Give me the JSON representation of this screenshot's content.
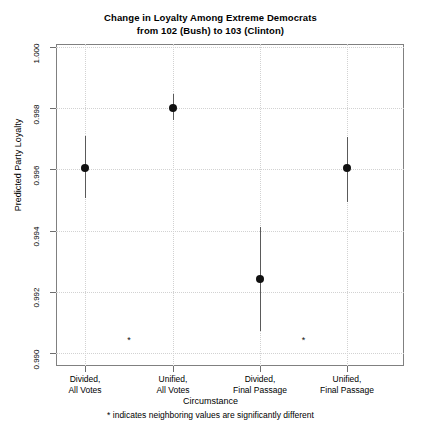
{
  "chart_data": {
    "type": "scatter",
    "title": "Change in Loyalty Among Extreme Democrats",
    "subtitle": "from 102 (Bush) to 103 (Clinton)",
    "xlabel": "Circumstance",
    "ylabel": "Predicted Party Loyalty",
    "footnote": "* indicates neighboring values are significantly different",
    "categories": [
      "Divided, All Votes",
      "Unified, All Votes",
      "Divided, Final Passage",
      "Unified, Final Passage"
    ],
    "category_lines": [
      [
        "Divided,",
        "All Votes"
      ],
      [
        "Unified,",
        "All Votes"
      ],
      [
        "Divided,",
        "Final Passage"
      ],
      [
        "Unified,",
        "Final Passage"
      ]
    ],
    "values": [
      0.99606,
      0.998,
      0.99243,
      0.99603
    ],
    "ci_lower": [
      0.99508,
      0.99761,
      0.99073,
      0.99495
    ],
    "ci_upper": [
      0.99708,
      0.99846,
      0.99411,
      0.99705
    ],
    "ylim": [
      0.99,
      1.0
    ],
    "yticks": [
      0.99,
      0.992,
      0.994,
      0.996,
      0.998,
      1.0
    ],
    "ytick_labels": [
      "0.990",
      "0.992",
      "0.994",
      "0.996",
      "0.998",
      "1.000"
    ],
    "grid": true,
    "legend": "none",
    "significance_markers": [
      {
        "between": "Divided, All Votes / Unified, All Votes",
        "label": "*",
        "x_value": 1.5,
        "y_value": 0.99043
      },
      {
        "between": "Divided, Final Passage / Unified, Final Passage",
        "label": "*",
        "x_value": 3.5,
        "y_value": 0.99043
      }
    ],
    "colors": {
      "point": "#111111",
      "errorbar": "#5a5a5a",
      "grid": "#d2d2d2",
      "frame": "#808080",
      "background": "#ffffff"
    }
  }
}
